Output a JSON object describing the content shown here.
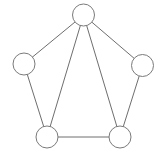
{
  "graph": {
    "node_radius": 11,
    "colors": {
      "background": "#ffffff",
      "edge": "#6e6e6e",
      "node_stroke": "#7a7a7a",
      "node_fill": "#ffffff"
    },
    "nodes": [
      {
        "id": "top",
        "x": 83.5,
        "y": 15
      },
      {
        "id": "left",
        "x": 24,
        "y": 64
      },
      {
        "id": "right",
        "x": 142.5,
        "y": 65.5
      },
      {
        "id": "bottom-left",
        "x": 47,
        "y": 137
      },
      {
        "id": "bottom-right",
        "x": 120,
        "y": 137
      }
    ],
    "edges": [
      [
        "top",
        "left"
      ],
      [
        "top",
        "right"
      ],
      [
        "top",
        "bottom-left"
      ],
      [
        "top",
        "bottom-right"
      ],
      [
        "left",
        "bottom-left"
      ],
      [
        "right",
        "bottom-right"
      ],
      [
        "bottom-left",
        "bottom-right"
      ]
    ]
  }
}
